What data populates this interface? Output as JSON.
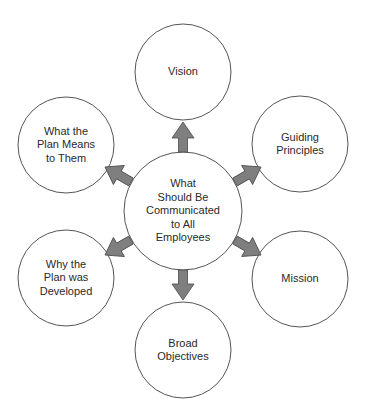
{
  "diagram": {
    "type": "hub-and-spoke",
    "colors": {
      "circle_stroke": "#555555",
      "arrow_fill": "#7f7f7f",
      "arrow_stroke": "#4a4a4a",
      "text": "#2a2a2a",
      "background": "#ffffff"
    },
    "center": {
      "label": "What\nShould Be\nCommunicated\nto All\nEmployees"
    },
    "nodes": [
      {
        "id": "vision",
        "label": "Vision"
      },
      {
        "id": "guiding-principles",
        "label": "Guiding\nPrinciples"
      },
      {
        "id": "mission",
        "label": "Mission"
      },
      {
        "id": "broad-objectives",
        "label": "Broad\nObjectives"
      },
      {
        "id": "why-developed",
        "label": "Why the\nPlan was\nDeveloped"
      },
      {
        "id": "what-means",
        "label": "What the\nPlan Means\nto Them"
      }
    ]
  }
}
